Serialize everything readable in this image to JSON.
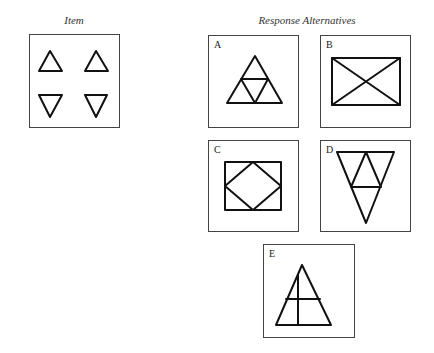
{
  "item": {
    "title": "Item",
    "title_pos": [
      74,
      14
    ],
    "box": {
      "x": 29,
      "y": 34,
      "w": 91,
      "h": 94
    },
    "shapes": [
      {
        "name": "triangle-up-1",
        "type": "polygon",
        "points": "20,16 32,36 9,36"
      },
      {
        "name": "triangle-up-2",
        "type": "polygon",
        "points": "66,16 78,36 55,36"
      },
      {
        "name": "triangle-down-1",
        "type": "polygon",
        "points": "9,60 32,60 20,82"
      },
      {
        "name": "triangle-down-2",
        "type": "polygon",
        "points": "55,60 77,60 66,82"
      }
    ]
  },
  "alternatives": {
    "title": "Response Alternatives",
    "title_pos": [
      307,
      14
    ],
    "options": [
      {
        "label": "A",
        "box": {
          "x": 208,
          "y": 35,
          "w": 91,
          "h": 93
        },
        "shapes": [
          {
            "name": "outer-triangle",
            "type": "polygon",
            "points": "46,20 73,67 18,67"
          },
          {
            "name": "inner-triangle",
            "type": "polygon",
            "points": "32,43 59,43 46,67"
          }
        ]
      },
      {
        "label": "B",
        "box": {
          "x": 320,
          "y": 35,
          "w": 91,
          "h": 93
        },
        "shapes": [
          {
            "name": "rectangle",
            "type": "polygon",
            "points": "11,22 79,22 79,69 11,69"
          },
          {
            "name": "diagonal-1",
            "type": "line",
            "points": "11,22 79,69"
          },
          {
            "name": "diagonal-2",
            "type": "line",
            "points": "79,22 11,69"
          }
        ]
      },
      {
        "label": "C",
        "box": {
          "x": 208,
          "y": 140,
          "w": 91,
          "h": 92
        },
        "shapes": [
          {
            "name": "rectangle",
            "type": "polygon",
            "points": "16,21 72,21 72,69 16,69"
          },
          {
            "name": "diamond",
            "type": "polygon",
            "points": "44,21 72,45 44,69 16,45"
          }
        ]
      },
      {
        "label": "D",
        "box": {
          "x": 320,
          "y": 140,
          "w": 91,
          "h": 92
        },
        "shapes": [
          {
            "name": "outer-triangle-inverted",
            "type": "polygon",
            "points": "16,11 73,11 45,82"
          },
          {
            "name": "inner-triangle",
            "type": "polygon",
            "points": "45,11 60,46 30,46"
          }
        ]
      },
      {
        "label": "E",
        "box": {
          "x": 263,
          "y": 244,
          "w": 92,
          "h": 94
        },
        "shapes": [
          {
            "name": "outer-triangle",
            "type": "polygon",
            "points": "38,20 67,80 12,80"
          },
          {
            "name": "horizontal-line",
            "type": "line",
            "points": "22,54 56,54"
          },
          {
            "name": "vertical-line",
            "type": "line",
            "points": "34,30 34,80"
          }
        ]
      }
    ]
  }
}
